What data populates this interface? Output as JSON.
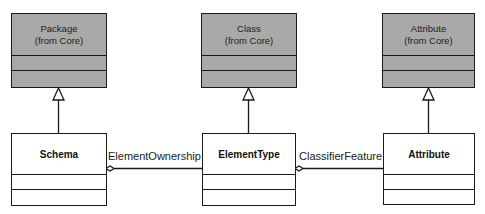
{
  "diagram": {
    "type": "UML class diagram",
    "superclasses": [
      {
        "id": "package",
        "name": "Package",
        "stereo": "(from Core)"
      },
      {
        "id": "class",
        "name": "Class",
        "stereo": "(from Core)"
      },
      {
        "id": "attribute-core",
        "name": "Attribute",
        "stereo": "(from Core)"
      }
    ],
    "classes": [
      {
        "id": "schema",
        "name": "Schema"
      },
      {
        "id": "elementtype",
        "name": "ElementType"
      },
      {
        "id": "attribute",
        "name": "Attribute"
      }
    ],
    "associations": [
      {
        "label": "ElementOwnership",
        "from": "Schema",
        "to": "ElementType",
        "aggregate_end": "Schema"
      },
      {
        "label": "ClassifierFeature",
        "from": "ElementType",
        "to": "Attribute",
        "aggregate_end": "ElementType"
      }
    ],
    "generalizations": [
      {
        "child": "Schema",
        "parent": "Package"
      },
      {
        "child": "ElementType",
        "parent": "Class"
      },
      {
        "child": "Attribute",
        "parent": "Attribute (from Core)"
      }
    ],
    "colors": {
      "superclass_fill": "#a9a9a9",
      "class_fill": "#ffffff",
      "line": "#1a1a1a"
    }
  }
}
